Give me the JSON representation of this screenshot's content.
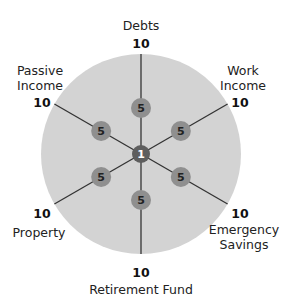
{
  "diagram": {
    "center_value": "1",
    "max_value": 10,
    "colors": {
      "disc": "#d3d3d3",
      "spoke": "#333333",
      "node": "#8f8f8f",
      "center": "#5e5e5e"
    },
    "axes": [
      {
        "name": "Debts",
        "label_lines": [
          "Debts"
        ],
        "max": "10",
        "node": "5"
      },
      {
        "name": "Work Income",
        "label_lines": [
          "Work",
          "Income"
        ],
        "max": "10",
        "node": "5"
      },
      {
        "name": "Emergency Savings",
        "label_lines": [
          "Emergency",
          "Savings"
        ],
        "max": "10",
        "node": "5"
      },
      {
        "name": "Retirement Fund",
        "label_lines": [
          "Retirement Fund"
        ],
        "max": "10",
        "node": "5"
      },
      {
        "name": "Property",
        "label_lines": [
          "Property"
        ],
        "max": "10",
        "node": "5"
      },
      {
        "name": "Passive Income",
        "label_lines": [
          "Passive",
          "Income"
        ],
        "max": "10",
        "node": "5"
      }
    ]
  }
}
